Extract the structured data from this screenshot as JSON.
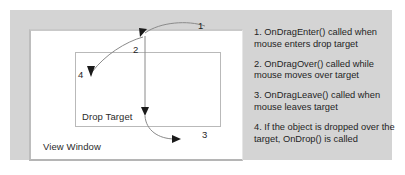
{
  "diagram": {
    "view_window_label": "View Window",
    "drop_target_label": "Drop Target",
    "callouts": [
      {
        "id": "1",
        "label": "1"
      },
      {
        "id": "2",
        "label": "2"
      },
      {
        "id": "3",
        "label": "3"
      },
      {
        "id": "4",
        "label": "4"
      }
    ]
  },
  "legend": {
    "items": [
      {
        "text": "1. OnDragEnter() called when mouse enters drop target"
      },
      {
        "text": "2. OnDragOver() called while mouse moves over target"
      },
      {
        "text": "3. OnDragLeave() called when mouse leaves target"
      },
      {
        "text": "4. If the object is dropped over the target, OnDrop() is called"
      }
    ]
  },
  "colors": {
    "panel_background": "#d4d4d4",
    "view_window_background": "#ffffff",
    "box_border": "#b9b9b9",
    "arrow_stroke": "#8a8a8a",
    "arrow_head": "#1a1a1a",
    "text": "#1f1f1f"
  }
}
